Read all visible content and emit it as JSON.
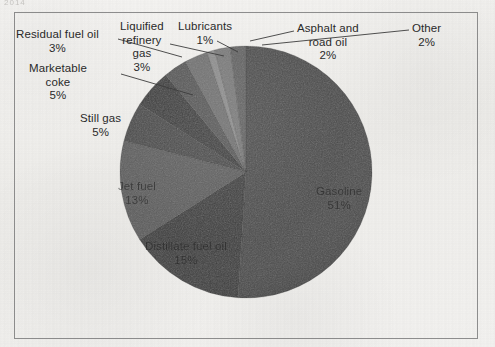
{
  "page": {
    "top_fragment": "2014",
    "background_color": "#f2f1ef",
    "frame_color": "#8d8d8d"
  },
  "chart_data": {
    "type": "pie",
    "title": "",
    "subtitle": "",
    "xlabel": "",
    "ylabel": "",
    "legend_position": "none",
    "grid": false,
    "start_angle_deg": 0,
    "direction": "clockwise",
    "total": 100,
    "unit": "%",
    "categories": [
      "Gasoline",
      "Distillate fuel oil",
      "Jet fuel",
      "Still gas",
      "Marketable coke",
      "Residual fuel oil",
      "Liquified refinery gas",
      "Lubricants",
      "Asphalt and road oil",
      "Other"
    ],
    "values": [
      51,
      15,
      13,
      5,
      5,
      3,
      3,
      1,
      2,
      2
    ],
    "slices": [
      {
        "label": "Gasoline",
        "value": 51,
        "pct_text": "51%",
        "color": "#4a4a4a",
        "label_placement": "inside"
      },
      {
        "label": "Distillate fuel oil",
        "value": 15,
        "pct_text": "15%",
        "color": "#3b3b3b",
        "label_placement": "inside"
      },
      {
        "label": "Jet fuel",
        "value": 13,
        "pct_text": "13%",
        "color": "#5c5c5c",
        "label_placement": "inside"
      },
      {
        "label": "Still gas",
        "value": 5,
        "pct_text": "5%",
        "color": "#474747",
        "label_placement": "outside"
      },
      {
        "label": "Marketable coke",
        "value": 5,
        "pct_text": "5%",
        "color": "#393939",
        "label_placement": "outside"
      },
      {
        "label": "Residual fuel oil",
        "value": 3,
        "pct_text": "3%",
        "color": "#545454",
        "label_placement": "outside"
      },
      {
        "label": "Liquified refinery gas",
        "value": 3,
        "pct_text": "3%",
        "color": "#6f6f6f",
        "label_placement": "outside"
      },
      {
        "label": "Lubricants",
        "value": 1,
        "pct_text": "1%",
        "color": "#8c8c8c",
        "label_placement": "outside"
      },
      {
        "label": "Asphalt and road oil",
        "value": 2,
        "pct_text": "2%",
        "color": "#787878",
        "label_placement": "outside"
      },
      {
        "label": "Other",
        "value": 2,
        "pct_text": "2%",
        "color": "#606060",
        "label_placement": "outside"
      }
    ]
  },
  "labels": {
    "gasoline": {
      "name": "Gasoline",
      "pct": "51%"
    },
    "distillate": {
      "name": "Distillate fuel oil",
      "pct": "15%"
    },
    "jetfuel": {
      "name": "Jet fuel",
      "pct": "13%"
    },
    "stillgas": {
      "name": "Still gas",
      "pct": "5%"
    },
    "coke_l1": {
      "name": "Marketable",
      "l2": "coke",
      "pct": "5%"
    },
    "residual": {
      "name": "Residual fuel oil",
      "pct": "3%"
    },
    "lrg_l1": {
      "name": "Liquified",
      "l2": "refinery",
      "l3": "gas",
      "pct": "3%"
    },
    "lubricants": {
      "name": "Lubricants",
      "pct": "1%"
    },
    "asphalt_l1": {
      "name": "Asphalt and",
      "l2": "road oil",
      "pct": "2%"
    },
    "other": {
      "name": "Other",
      "pct": "2%"
    }
  }
}
